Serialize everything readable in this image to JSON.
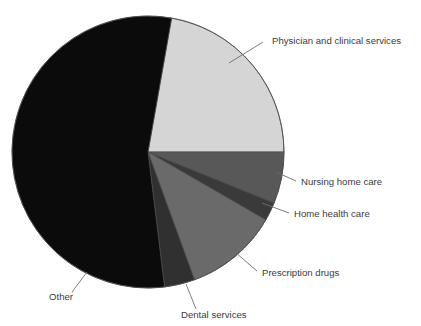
{
  "chart_data": {
    "type": "pie",
    "title": "",
    "subtitle": "",
    "xlabel": "",
    "ylabel": "",
    "legend_position": "none",
    "grid": false,
    "labels_placement": "outside-with-leader-lines",
    "start_angle_deg_from_top": 10,
    "direction": "clockwise",
    "categories": [
      "Physician and clinical services",
      "Nursing home care",
      "Home health care",
      "Prescription drugs",
      "Dental services",
      "Other"
    ],
    "values": [
      22,
      6,
      2.5,
      11,
      4,
      54.5
    ],
    "units": "percent",
    "slices": [
      {
        "label": "Physician and clinical services",
        "value": 22,
        "color": "#d5d5d5",
        "start_deg": 10,
        "end_deg": 90,
        "label_x": 272,
        "label_y": 44,
        "leader": [
          [
            229,
            63
          ],
          [
            263,
            42
          ]
        ]
      },
      {
        "label": "Nursing home care",
        "value": 6,
        "color": "#585858",
        "start_deg": 90,
        "end_deg": 112,
        "label_x": 301,
        "label_y": 185,
        "leader": [
          [
            276,
            172
          ],
          [
            296,
            181
          ]
        ]
      },
      {
        "label": "Home health care",
        "value": 2.5,
        "color": "#3a3a3a",
        "start_deg": 112,
        "end_deg": 120,
        "label_x": 294,
        "label_y": 217,
        "leader": [
          [
            262,
            203
          ],
          [
            289,
            213
          ]
        ]
      },
      {
        "label": "Prescription drugs",
        "value": 11,
        "color": "#6a6a6a",
        "start_deg": 120,
        "end_deg": 160,
        "label_x": 262,
        "label_y": 276,
        "leader": [
          [
            235,
            252
          ],
          [
            257,
            271
          ]
        ]
      },
      {
        "label": "Dental services",
        "value": 4,
        "color": "#303030",
        "start_deg": 160,
        "end_deg": 173,
        "label_x": 181,
        "label_y": 318,
        "leader": [
          [
            186,
            284
          ],
          [
            196,
            309
          ]
        ]
      },
      {
        "label": "Other",
        "value": 54.5,
        "color": "#0b0b0b",
        "start_deg": 173,
        "end_deg": 370,
        "label_x": 49,
        "label_y": 300,
        "leader": [
          [
            87,
            272
          ],
          [
            72,
            292
          ]
        ]
      }
    ],
    "geometry": {
      "center_x": 148,
      "center_y": 152,
      "radius": 136
    },
    "background_color": "#ffffff",
    "outline_color": "#4a4a4a",
    "label_color": "#3b3b3b"
  }
}
